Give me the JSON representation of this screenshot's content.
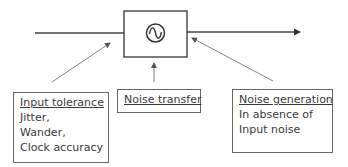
{
  "diagram": {
    "block": {
      "symbol": "sine-wave-oscillator"
    },
    "labels": {
      "input_tolerance": {
        "title": "Input tolerance",
        "lines": [
          "Jitter,",
          "Wander,",
          "Clock accuracy"
        ]
      },
      "noise_transfer": {
        "title": "Noise transfer"
      },
      "noise_generation": {
        "title": "Noise generation",
        "lines": [
          "In absence of",
          "Input noise"
        ]
      }
    },
    "colors": {
      "stroke": "#333333",
      "arrow_thin": "#777777",
      "box_border": "#666666"
    }
  }
}
